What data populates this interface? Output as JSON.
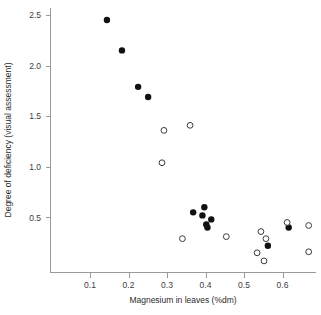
{
  "chart_data": {
    "type": "scatter",
    "title": "",
    "xlabel": "Magnesium in leaves (%dm)",
    "ylabel": "Degree of deficiency (visual assessment)",
    "xlim": [
      0.02,
      0.65
    ],
    "ylim": [
      0.0,
      2.62
    ],
    "xticks": [
      0.1,
      0.2,
      0.3,
      0.4,
      0.5,
      0.6
    ],
    "xticklabels": [
      "0.1",
      "0.2",
      "0.3",
      "0.4",
      "0.5",
      "0.6"
    ],
    "yticks": [
      0.5,
      1.0,
      1.5,
      2.0,
      2.5
    ],
    "yticklabels": [
      "0.5",
      "1.0",
      "1.5",
      "2.0",
      "2.5"
    ],
    "grid": false,
    "legend": "none",
    "series": [
      {
        "name": "filled-circles",
        "marker": "filled circle",
        "color": "#111111",
        "points": [
          {
            "x": 0.144,
            "y": 2.45
          },
          {
            "x": 0.183,
            "y": 2.15
          },
          {
            "x": 0.225,
            "y": 1.79
          },
          {
            "x": 0.251,
            "y": 1.69
          },
          {
            "x": 0.368,
            "y": 0.55
          },
          {
            "x": 0.397,
            "y": 0.6
          },
          {
            "x": 0.392,
            "y": 0.52
          },
          {
            "x": 0.415,
            "y": 0.48
          },
          {
            "x": 0.402,
            "y": 0.43
          },
          {
            "x": 0.405,
            "y": 0.4
          },
          {
            "x": 0.562,
            "y": 0.22
          },
          {
            "x": 0.616,
            "y": 0.4
          }
        ]
      },
      {
        "name": "open-circles",
        "marker": "open circle",
        "color": "#3a3a3a",
        "points": [
          {
            "x": 0.292,
            "y": 1.36
          },
          {
            "x": 0.36,
            "y": 1.41
          },
          {
            "x": 0.287,
            "y": 1.04
          },
          {
            "x": 0.34,
            "y": 0.29
          },
          {
            "x": 0.454,
            "y": 0.31
          },
          {
            "x": 0.544,
            "y": 0.36
          },
          {
            "x": 0.557,
            "y": 0.29
          },
          {
            "x": 0.534,
            "y": 0.15
          },
          {
            "x": 0.552,
            "y": 0.07
          },
          {
            "x": 0.612,
            "y": 0.45
          },
          {
            "x": 0.668,
            "y": 0.42
          },
          {
            "x": 0.668,
            "y": 0.16
          }
        ]
      }
    ]
  },
  "axes": {
    "x_title": "Magnesium in leaves (%dm)",
    "y_title": "Degree of deficiency (visual assessment)"
  }
}
